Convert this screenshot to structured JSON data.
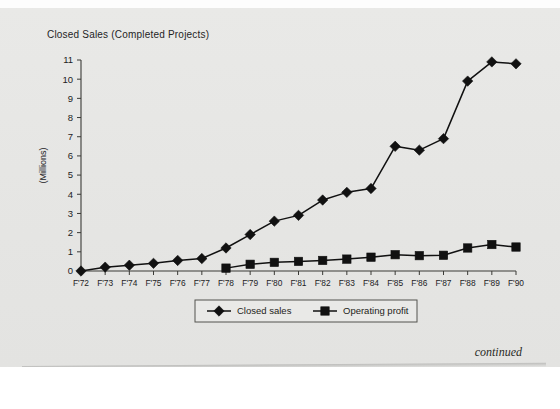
{
  "page": {
    "title": "Closed Sales (Completed Projects)",
    "footer_note": "continued"
  },
  "chart_data": {
    "type": "line",
    "title": "Closed Sales (Completed Projects)",
    "xlabel": "",
    "ylabel": "(Millions)",
    "ylim": [
      0,
      11
    ],
    "ytick_step": 1,
    "yticks": [
      "0",
      "1",
      "2",
      "3",
      "4",
      "5",
      "6",
      "7",
      "8",
      "9",
      "10",
      "11"
    ],
    "grid": false,
    "legend_position": "bottom-center",
    "categories": [
      "F'72",
      "F'73",
      "F'74",
      "F'75",
      "F'76",
      "F'77",
      "F'78",
      "F'79",
      "F'80",
      "F'81",
      "F'82",
      "F'83",
      "F'84",
      "F'85",
      "F'86",
      "F'87",
      "F'88",
      "F'89",
      "F'90"
    ],
    "series": [
      {
        "name": "Closed sales",
        "marker": "diamond",
        "color": "#111111",
        "values": [
          0.0,
          0.2,
          0.3,
          0.4,
          0.55,
          0.65,
          1.2,
          1.9,
          2.6,
          2.9,
          3.7,
          4.1,
          4.3,
          6.5,
          6.3,
          6.9,
          9.9,
          10.9,
          10.8
        ]
      },
      {
        "name": "Operating profit",
        "marker": "square",
        "color": "#111111",
        "values": [
          null,
          null,
          null,
          null,
          null,
          null,
          0.15,
          0.35,
          0.45,
          0.5,
          0.55,
          0.62,
          0.72,
          0.85,
          0.8,
          0.82,
          1.2,
          1.38,
          1.25
        ]
      }
    ]
  },
  "legend": {
    "items": [
      {
        "label": "Closed sales",
        "marker": "diamond"
      },
      {
        "label": "Operating profit",
        "marker": "square"
      }
    ]
  }
}
